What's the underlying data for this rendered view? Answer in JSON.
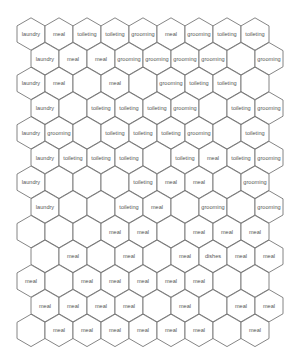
{
  "diagram": {
    "type": "hex-grid",
    "rows": 13,
    "columns": 9,
    "colors": {
      "stroke": "#666666",
      "fill": "#ffffff",
      "text": "#555555"
    },
    "cells": [
      [
        "laundry",
        "meal",
        "toileting",
        "toileting",
        "grooming",
        "meal",
        "grooming",
        "toileting",
        "toileting"
      ],
      [
        "laundry",
        "meal",
        "meal",
        "grooming",
        "grooming",
        "grooming",
        "grooming",
        "",
        "grooming"
      ],
      [
        "laundry",
        "meal",
        "",
        "meal",
        "",
        "grooming",
        "toileting",
        "toileting",
        ""
      ],
      [
        "laundry",
        "",
        "toileting",
        "toileting",
        "toileting",
        "grooming",
        "",
        "toileting",
        "grooming"
      ],
      [
        "laundry",
        "grooming",
        "",
        "toileting",
        "toileting",
        "toileting",
        "grooming",
        "",
        "toileting"
      ],
      [
        "laundry",
        "toileting",
        "toileting",
        "toileting",
        "",
        "toileting",
        "meal",
        "toileting",
        "grooming"
      ],
      [
        "laundry",
        "",
        "",
        "",
        "toileting",
        "meal",
        "meal",
        "",
        "grooming"
      ],
      [
        "laundry",
        "",
        "",
        "toileting",
        "meal",
        "",
        "grooming",
        "",
        "grooming"
      ],
      [
        "",
        "",
        "",
        "meal",
        "meal",
        "",
        "meal",
        "meal",
        "meal"
      ],
      [
        "",
        "meal",
        "",
        "meal",
        "",
        "meal",
        "dishes",
        "meal",
        "meal"
      ],
      [
        "meal",
        "",
        "meal",
        "meal",
        "meal",
        "meal",
        "meal",
        "",
        ""
      ],
      [
        "meal",
        "meal",
        "meal",
        "meal",
        "",
        "meal",
        "",
        "meal",
        "meal"
      ],
      [
        "",
        "meal",
        "meal",
        "meal",
        "meal",
        "meal",
        "meal",
        "",
        "meal"
      ]
    ]
  }
}
